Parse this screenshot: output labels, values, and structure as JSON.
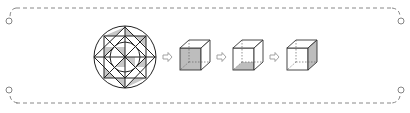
{
  "figure": {
    "items": [
      {
        "id": "pattern",
        "type": "circle-star-pattern"
      },
      {
        "id": "cube1",
        "type": "cube",
        "shaded_face": "front"
      },
      {
        "id": "cube2",
        "type": "cube",
        "shaded_face": "bottom"
      },
      {
        "id": "cube3",
        "type": "cube",
        "shaded_face": "right"
      }
    ],
    "arrows": [
      "arrow-1",
      "arrow-2",
      "arrow-3"
    ],
    "colors": {
      "line": "#222222",
      "shade": "#c8c8c8",
      "frame": "#888888",
      "arrow": "#999999"
    }
  }
}
